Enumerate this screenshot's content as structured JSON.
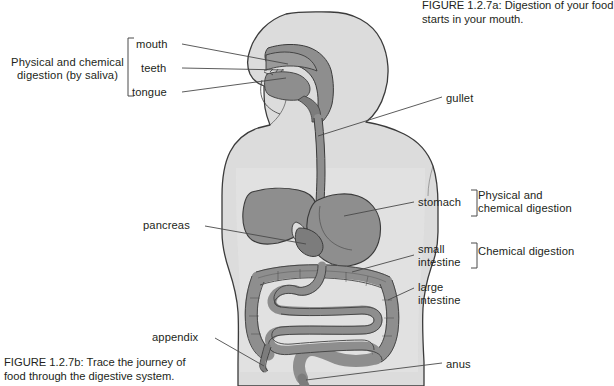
{
  "figure": {
    "caption_a": "FIGURE 1.2.7a: Digestion of your food\nstarts in your mouth.",
    "caption_b": "FIGURE 1.2.7b: Trace the journey of\nfood through the digestive system.",
    "colors": {
      "body_fill": "#dcdcdc",
      "organ_fill": "#8e8e8e",
      "organ_fill_dark": "#7c7c7c",
      "outline": "#3b3b3b",
      "leader_line": "#4a4a4a",
      "text": "#231f20",
      "page_background": "#ffffff"
    }
  },
  "labels": {
    "left": [
      {
        "id": "mouth",
        "text": "mouth"
      },
      {
        "id": "teeth",
        "text": "teeth"
      },
      {
        "id": "tongue",
        "text": "tongue"
      },
      {
        "id": "pancreas",
        "text": "pancreas"
      },
      {
        "id": "appendix",
        "text": "appendix"
      }
    ],
    "right": [
      {
        "id": "gullet",
        "text": "gullet"
      },
      {
        "id": "stomach",
        "text": "stomach"
      },
      {
        "id": "small_intestine",
        "text": "small\nintestine"
      },
      {
        "id": "large_intestine",
        "text": "large\nintestine"
      },
      {
        "id": "anus",
        "text": "anus"
      }
    ],
    "mouth": "mouth",
    "teeth": "teeth",
    "tongue": "tongue",
    "pancreas": "pancreas",
    "appendix": "appendix",
    "gullet": "gullet",
    "stomach": "stomach",
    "small_intestine": "small\nintestine",
    "large_intestine": "large\nintestine",
    "anus": "anus"
  },
  "groups": {
    "saliva": "Physical and chemical\ndigestion (by saliva)",
    "physical_chemical": "Physical and\nchemical digestion",
    "chemical": "Chemical digestion"
  }
}
